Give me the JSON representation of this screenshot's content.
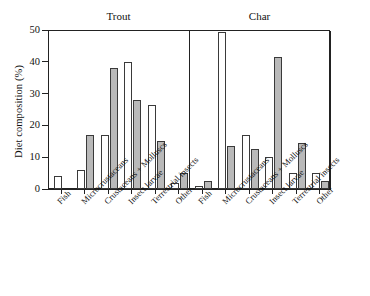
{
  "figure": {
    "ylabel": "Diet composition (%)",
    "panel_titles": [
      "Trout",
      "Char"
    ]
  },
  "axis": {
    "yticks": [
      "0",
      "10",
      "20",
      "30",
      "40",
      "50"
    ],
    "ytick_values": [
      0,
      10,
      20,
      30,
      40,
      50
    ]
  },
  "chart_data": {
    "type": "bar",
    "title": "",
    "xlabel": "",
    "ylabel": "Diet composition (%)",
    "ylim": [
      0,
      50
    ],
    "yticks": [
      0,
      10,
      20,
      30,
      40,
      50
    ],
    "grid": false,
    "legend_position": "none",
    "panels": [
      {
        "name": "Trout",
        "categories": [
          "Fish",
          "Microcrustaceans",
          "Crustaceans + Molluscs",
          "Insect larvae",
          "Terrestrial insects",
          "Other"
        ],
        "series": [
          {
            "name": "open",
            "fill": "white",
            "values": [
              4,
              6,
              17,
              40,
              26.5,
              2
            ]
          },
          {
            "name": "filled",
            "fill": "grey",
            "values": [
              0,
              17,
              38,
              28,
              15,
              5
            ]
          }
        ]
      },
      {
        "name": "Char",
        "categories": [
          "Fish",
          "Microcrustaceans",
          "Crustaceans + Molluscs",
          "Insect larvae",
          "Terrestrial insects",
          "Other"
        ],
        "series": [
          {
            "name": "open",
            "fill": "white",
            "values": [
              1,
              49.5,
              17,
              10,
              5,
              5
            ]
          },
          {
            "name": "filled",
            "fill": "grey",
            "values": [
              2.5,
              13.5,
              12.5,
              41.5,
              14.5,
              2.5
            ]
          }
        ]
      }
    ],
    "colors": {
      "open_bar": "#ffffff",
      "filled_bar": "#b9b9b9",
      "outline": "#3a3a3a",
      "axis": "#222222"
    }
  }
}
